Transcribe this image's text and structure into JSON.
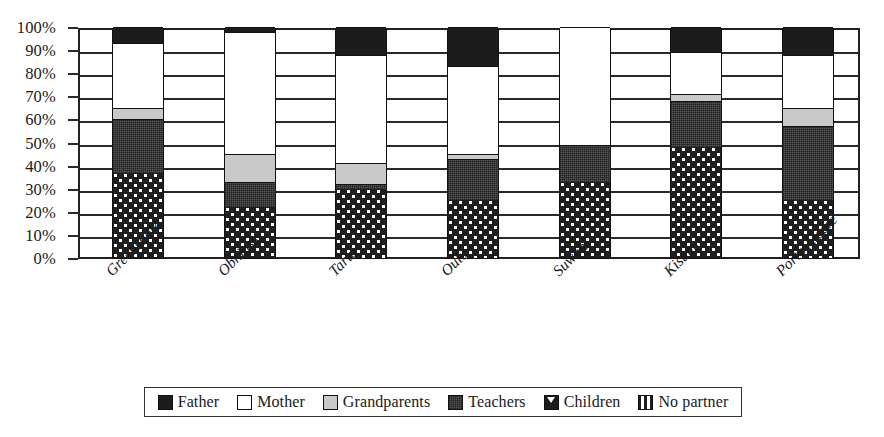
{
  "chart_data": {
    "type": "bar",
    "subtype": "stacked-percentage",
    "title": "",
    "xlabel": "",
    "ylabel": "",
    "ylim": [
      0,
      100
    ],
    "grid": true,
    "legend_position": "bottom",
    "axis_unit": "%",
    "categories": [
      "Greensboro",
      "Obninsk",
      "Tartu",
      "Oulu",
      "Suwon",
      "Kisumu",
      "Porto Alegre"
    ],
    "ytick_labels": [
      "100%",
      "90%",
      "80%",
      "70%",
      "60%",
      "50%",
      "40%",
      "30%",
      "20%",
      "10%",
      "0%"
    ],
    "ytick_values": [
      100,
      90,
      80,
      70,
      60,
      50,
      40,
      30,
      20,
      10,
      0
    ],
    "series": [
      {
        "name": "No partner",
        "color": "#1e1e1e",
        "pattern": "vertical-stripes",
        "values": [
          37,
          22,
          30,
          25,
          33,
          48,
          25
        ]
      },
      {
        "name": "Children",
        "color": "#1c1c1c",
        "pattern": "triangles",
        "values": [
          0,
          0,
          0,
          0,
          0,
          0,
          0
        ]
      },
      {
        "name": "Teachers",
        "color": "#555555",
        "pattern": "cross-hatch",
        "values": [
          23,
          11,
          2,
          18,
          16,
          20,
          32
        ]
      },
      {
        "name": "Grandparents",
        "color": "#c9c9c9",
        "pattern": "solid-light",
        "values": [
          5,
          12,
          9,
          2,
          0,
          3,
          8
        ]
      },
      {
        "name": "Mother",
        "color": "#ffffff",
        "pattern": "solid-white",
        "values": [
          28,
          53,
          47,
          38,
          51,
          18,
          23
        ]
      },
      {
        "name": "Father",
        "color": "#1c1c1c",
        "pattern": "solid-black",
        "values": [
          7,
          2,
          12,
          17,
          0,
          11,
          12
        ]
      }
    ],
    "stack_order_bottom_to_top": [
      "No partner",
      "Children",
      "Teachers",
      "Grandparents",
      "Mother",
      "Father"
    ]
  },
  "legend": {
    "items": [
      {
        "label": "Father",
        "swatch": "black-square-icon"
      },
      {
        "label": "Mother",
        "swatch": "white-square-icon"
      },
      {
        "label": "Grandparents",
        "swatch": "light-gray-square-icon"
      },
      {
        "label": "Teachers",
        "swatch": "dark-gray-square-icon"
      },
      {
        "label": "Children",
        "swatch": "triangle-pattern-square-icon"
      },
      {
        "label": "No partner",
        "swatch": "striped-square-icon"
      }
    ]
  }
}
